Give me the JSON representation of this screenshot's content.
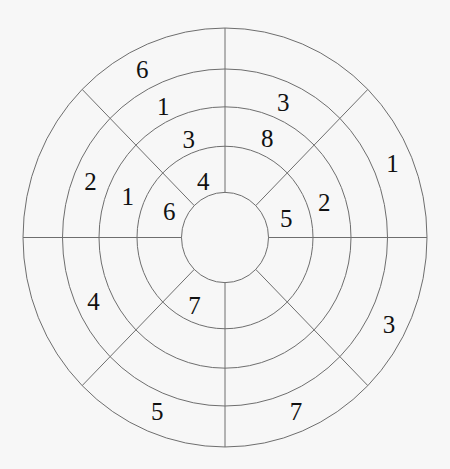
{
  "diagram": {
    "title": "",
    "rings": [
      "A",
      "B",
      "C",
      "D"
    ],
    "ring_order_note": "A is innermost ring, D is outermost ring",
    "sector_count": 8,
    "colors": {
      "line": "#6e6e6e",
      "text": "#111111",
      "background": "#f7f7f7"
    },
    "cells": [
      {
        "sector": 0,
        "ring": "A",
        "value": "5"
      },
      {
        "sector": 0,
        "ring": "B",
        "value": "2"
      },
      {
        "sector": 0,
        "ring": "D",
        "value": "1"
      },
      {
        "sector": 1,
        "ring": "B",
        "value": "8"
      },
      {
        "sector": 1,
        "ring": "C",
        "value": "3"
      },
      {
        "sector": 2,
        "ring": "A",
        "value": "4"
      },
      {
        "sector": 2,
        "ring": "B",
        "value": "3"
      },
      {
        "sector": 2,
        "ring": "C",
        "value": "1"
      },
      {
        "sector": 2,
        "ring": "D",
        "value": "6"
      },
      {
        "sector": 3,
        "ring": "A",
        "value": "6"
      },
      {
        "sector": 3,
        "ring": "B",
        "value": "1"
      },
      {
        "sector": 3,
        "ring": "C",
        "value": "2"
      },
      {
        "sector": 4,
        "ring": "C",
        "value": "4"
      },
      {
        "sector": 5,
        "ring": "A",
        "value": "7"
      },
      {
        "sector": 5,
        "ring": "D",
        "value": "5"
      },
      {
        "sector": 6,
        "ring": "D",
        "value": "7"
      },
      {
        "sector": 7,
        "ring": "D",
        "value": "3"
      }
    ]
  }
}
